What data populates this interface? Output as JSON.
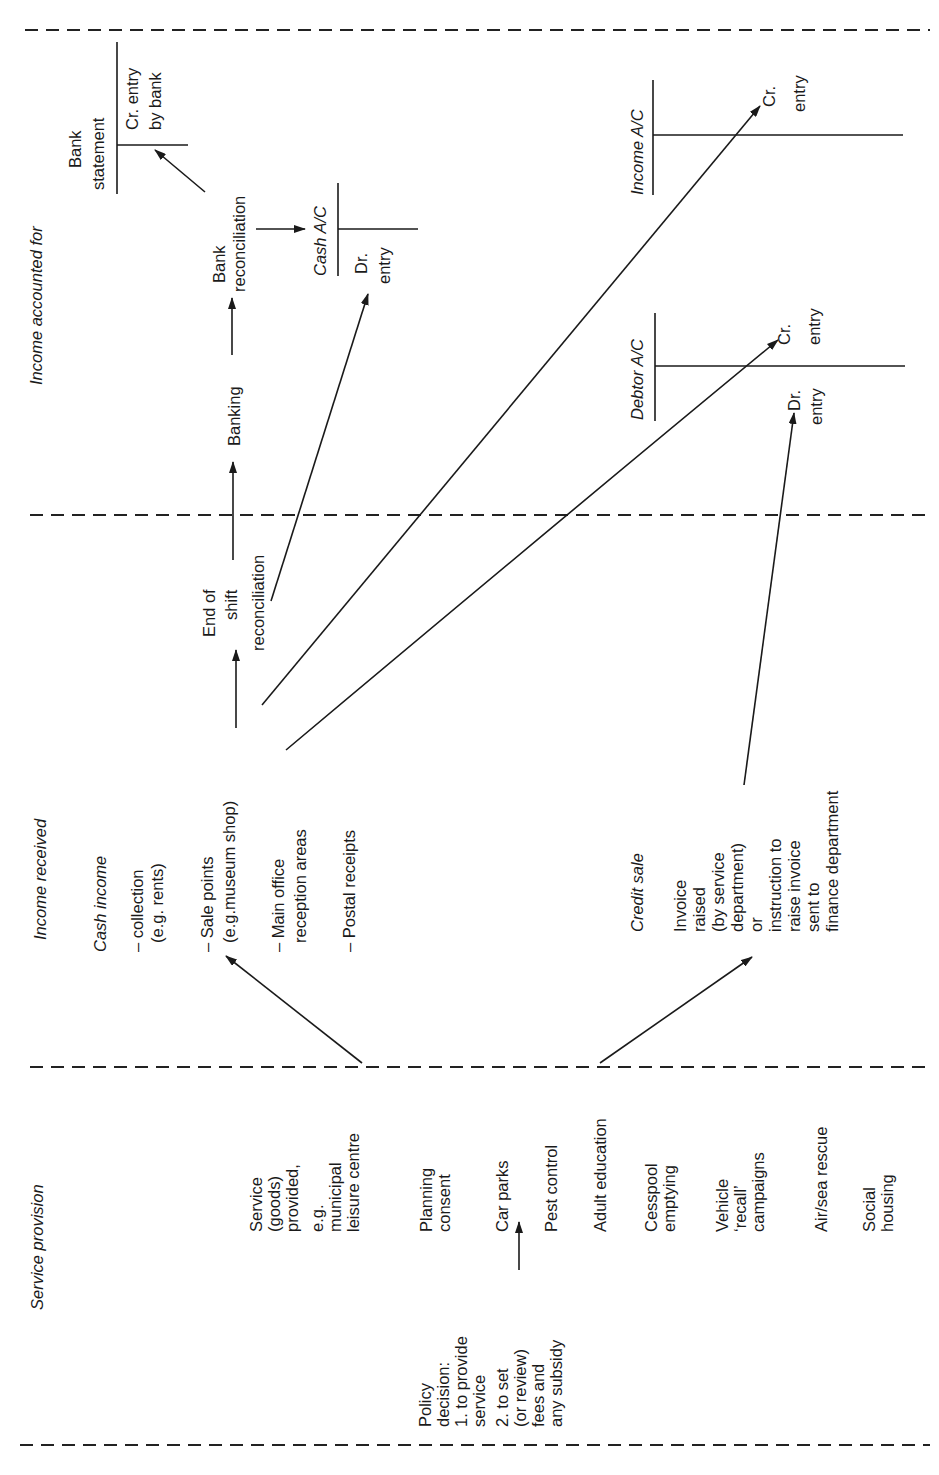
{
  "sections": {
    "service_provision": "Service provision",
    "income_received": "Income received",
    "income_accounted_for": "Income accounted for"
  },
  "service": {
    "policy": [
      "Policy",
      "decision:",
      "1. to provide",
      "service",
      "2. to set",
      "(or review)",
      "fees and",
      "any subsidy"
    ],
    "header": [
      "Service",
      "(goods)",
      "provided,"
    ],
    "example": [
      "e.g.",
      "municipal",
      "leisure centre"
    ],
    "items": [
      [
        "Planning",
        "consent"
      ],
      [
        "Car parks"
      ],
      [
        "Pest control"
      ],
      [
        "Adult education"
      ],
      [
        "Cesspool",
        "emptying"
      ],
      [
        "Vehicle",
        "‘recall’",
        "campaigns"
      ],
      [
        "Air/sea rescue"
      ],
      [
        "Social",
        "housing"
      ]
    ]
  },
  "income": {
    "cash_title": "Cash income",
    "cash_items": [
      [
        "– collection",
        "(e.g. rents)"
      ],
      [
        "– Sale points",
        "(e.g.museum shop)"
      ],
      [
        "– Main office",
        "reception areas"
      ],
      [
        "– Postal receipts"
      ]
    ],
    "end_of_shift": [
      "End of",
      "shift",
      "reconciliation"
    ],
    "credit_title": "Credit sale",
    "credit_items": [
      "Invoice",
      "raised",
      "(by service",
      "department)",
      "or",
      "instruction to",
      "raise invoice",
      "sent to",
      "finance department"
    ]
  },
  "accounting": {
    "banking": "Banking",
    "bank_reconciliation": [
      "Bank",
      "reconciliation"
    ],
    "bank_statement": [
      "Bank",
      "statement"
    ],
    "bank_cr": [
      "Cr. entry",
      "by bank"
    ],
    "cash_ac": "Cash A/C",
    "cash_dr": [
      "Dr.",
      "entry"
    ],
    "debtor_ac": "Debtor A/C",
    "debtor_dr": [
      "Dr.",
      "entry"
    ],
    "debtor_cr": [
      "Cr.",
      "entry"
    ],
    "income_ac": "Income A/C",
    "income_cr": [
      "Cr.",
      "entry"
    ]
  }
}
